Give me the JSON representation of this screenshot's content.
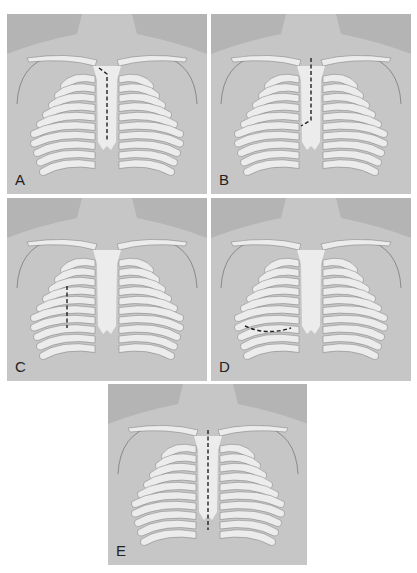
{
  "figure": {
    "colors": {
      "background": "#b4b4b4",
      "skin_highlight": "#d6d6d6",
      "bone": "#ececec",
      "intercostal": "#a8a8a8",
      "outline": "#7a7a7a",
      "incision": "#222222"
    },
    "panels": [
      {
        "label": "A",
        "incision": "partial upper sternotomy, J-shaped to right",
        "incision_path": "M-8,-12 L0,-6 L0,60"
      },
      {
        "label": "B",
        "incision": "partial upper sternotomy, J-shaped from top down, turning right-lateral",
        "incision_path": "M0,-22 L0,40 L-10,46"
      },
      {
        "label": "C",
        "incision": "right parasternal with rib segments resected",
        "incision_path": "M-40,22 L-40,64"
      },
      {
        "label": "D",
        "incision": "right anterior thoracotomy and lateral line",
        "incision_path": "M-66,62 Q-45,72 -20,64"
      },
      {
        "label": "E",
        "incision": "full median sternotomy with split sternum",
        "incision_path": "M0,-20 L0,80"
      }
    ]
  }
}
